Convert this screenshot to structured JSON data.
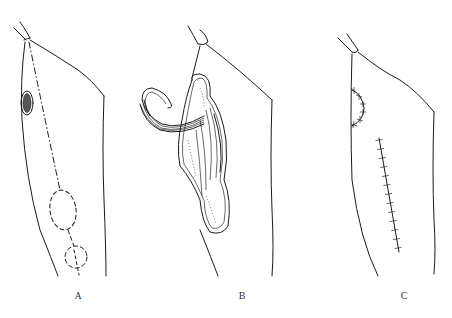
{
  "figure": {
    "panels": [
      {
        "id": "A",
        "label": "A",
        "description": "Thigh outline with donor skin island (oval, hatched) near upper lateral border, axis line dash-dot from hip down to two dashed circles marking flap design"
      },
      {
        "id": "B",
        "label": "B",
        "description": "Flap raised on muscle/vascular pedicle, rotated to cover defect; tubular pedicle with parallel lines and stippled muscle bed"
      },
      {
        "id": "C",
        "label": "C",
        "description": "Final closure: curved suture line at recipient site and straight sutured donor incision"
      }
    ],
    "colors": {
      "line": "#1a1a1a",
      "background": "#ffffff"
    }
  }
}
